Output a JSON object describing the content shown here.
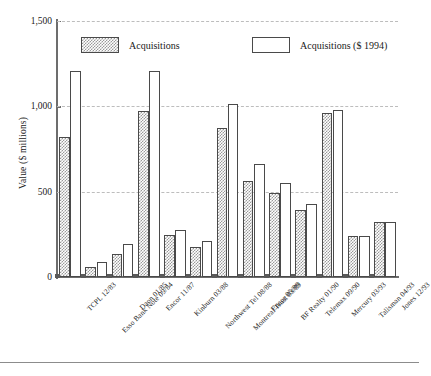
{
  "chart_data": {
    "type": "bar",
    "title": "",
    "subtitle": "",
    "xlabel": "",
    "ylabel": "Value ($ millions)",
    "ylim": [
      0,
      1500
    ],
    "yticks": [
      0,
      500,
      1000,
      1500
    ],
    "ytick_labels": [
      "0",
      "500",
      "1,000",
      "1,500"
    ],
    "grid": true,
    "legend_position": "top-inside",
    "categories": [
      "TCPL 12/83",
      "Esso Bank Note 09/84",
      "Daon 01/85",
      "Encor 11/87",
      "Kinburn 03/88",
      "Northwest Tel 08/88",
      "Montreal Trust 03/89",
      "Encor 05/89",
      "BF Realty 01/90",
      "Telemax 09/90",
      "Mercury 03/93",
      "Talisman 04/93",
      "Jones 12/93"
    ],
    "series": [
      {
        "name": "Acquisitions",
        "style": "hatched-grey",
        "values": [
          820,
          60,
          135,
          975,
          245,
          175,
          875,
          560,
          495,
          390,
          960,
          240,
          320
        ]
      },
      {
        "name": "Acquisitions ($ 1994)",
        "style": "open-white",
        "values": [
          1205,
          90,
          195,
          1210,
          275,
          210,
          1015,
          665,
          550,
          430,
          980,
          240,
          320
        ]
      }
    ]
  },
  "legend": {
    "items": [
      {
        "label": "Acquisitions",
        "swatch": "hatched"
      },
      {
        "label": "Acquisitions ($ 1994)",
        "swatch": "open"
      }
    ]
  },
  "axes": {
    "y_title": "Value ($ millions)",
    "y_tick_0": "0",
    "y_tick_500": "500",
    "y_tick_1000": "1,000",
    "y_tick_1500": "1,500"
  },
  "colors": {
    "hatch_fill": "#9a9a9a",
    "bar_outline": "#4a4a4a",
    "gridline": "#bdbdbd",
    "axis": "#6d6d6d",
    "text": "#1a1a1a",
    "background": "#ffffff"
  }
}
